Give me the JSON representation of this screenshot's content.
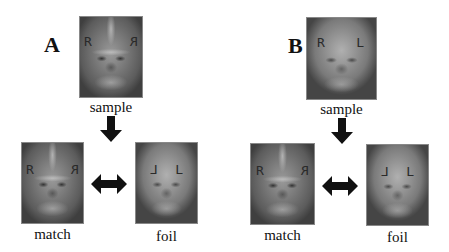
{
  "panels": [
    {
      "label": "A",
      "sample": {
        "caption": "sample",
        "left_letter": "R",
        "right_letter": "R",
        "right_mirrored": true
      },
      "match": {
        "caption": "match",
        "left_letter": "R",
        "right_letter": "R",
        "right_mirrored": true
      },
      "foil": {
        "caption": "foil",
        "left_letter": "L",
        "right_letter": "L",
        "left_mirrored": true
      }
    },
    {
      "label": "B",
      "sample": {
        "caption": "sample",
        "left_letter": "R",
        "right_letter": "L"
      },
      "match": {
        "caption": "match",
        "left_letter": "R",
        "right_letter": "R",
        "right_mirrored": true
      },
      "foil": {
        "caption": "foil",
        "left_letter": "L",
        "right_letter": "L",
        "left_mirrored": true
      }
    }
  ],
  "colors": {
    "arrow": "#111111",
    "background": "#ffffff"
  }
}
